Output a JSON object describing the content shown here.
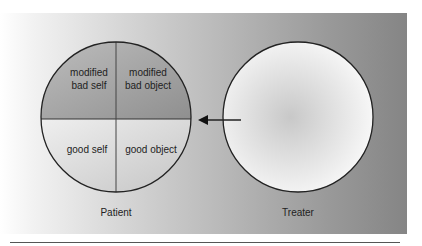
{
  "diagram": {
    "patient": {
      "label": "Patient",
      "quadrants": {
        "top_left": "modified\nbad self",
        "top_right": "modified\nbad object",
        "bottom_left": "good self",
        "bottom_right": "good object"
      }
    },
    "treater": {
      "label": "Treater"
    },
    "arrow": {
      "direction": "left",
      "from": "Treater",
      "to": "Patient"
    },
    "colors": {
      "top_half": "#9a9a9a",
      "bottom_half": "#dcdcdc",
      "outline": "#222222",
      "treater_center": "#cfcfcf",
      "treater_edge": "#fbfbfb"
    }
  }
}
